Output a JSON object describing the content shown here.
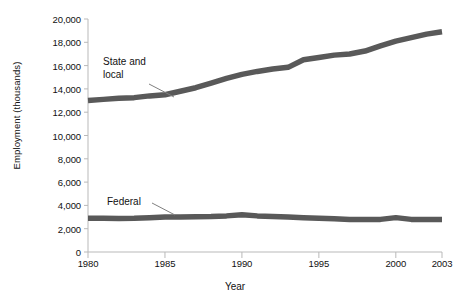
{
  "chart_data": {
    "type": "line",
    "title": "",
    "xlabel": "Year",
    "ylabel": "Employment (thousands)",
    "xlim": [
      1980,
      2003
    ],
    "ylim": [
      0,
      20000
    ],
    "xticks": [
      1980,
      1985,
      1990,
      1995,
      2000,
      2003
    ],
    "xtick_labels": [
      "1980",
      "1985",
      "1990",
      "1995",
      "2000",
      "2003"
    ],
    "yticks": [
      0,
      2000,
      4000,
      6000,
      8000,
      10000,
      12000,
      14000,
      16000,
      18000,
      20000
    ],
    "ytick_labels": [
      "0",
      "2,000",
      "4,000",
      "6,000",
      "8,000",
      "10,000",
      "12,000",
      "14,000",
      "16,000",
      "18,000",
      "20,000"
    ],
    "grid": false,
    "legend_position": "inline-annotations",
    "line_color": "#595959",
    "axis_color": "#b9b9b9",
    "x": [
      1980,
      1981,
      1982,
      1983,
      1984,
      1985,
      1986,
      1987,
      1988,
      1989,
      1990,
      1991,
      1992,
      1993,
      1994,
      1995,
      1996,
      1997,
      1998,
      1999,
      2000,
      2001,
      2002,
      2003
    ],
    "series": [
      {
        "name": "State and local",
        "label_text": "State and\nlocal",
        "values": [
          13000,
          13100,
          13200,
          13250,
          13400,
          13500,
          13800,
          14100,
          14500,
          14900,
          15250,
          15500,
          15700,
          15850,
          16500,
          16700,
          16900,
          17000,
          17250,
          17700,
          18100,
          18400,
          18700,
          18900
        ]
      },
      {
        "name": "Federal",
        "label_text": "Federal",
        "values": [
          2900,
          2890,
          2880,
          2900,
          2950,
          3000,
          3000,
          3030,
          3050,
          3100,
          3200,
          3100,
          3050,
          3000,
          2950,
          2900,
          2850,
          2800,
          2790,
          2800,
          2950,
          2800,
          2800,
          2800
        ]
      }
    ]
  },
  "labels": {
    "state_local": "State and\nlocal",
    "federal": "Federal"
  }
}
